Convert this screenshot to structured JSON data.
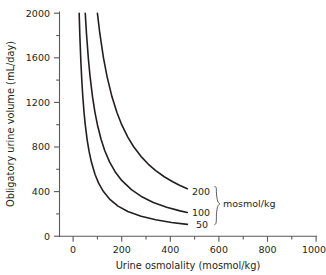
{
  "chart_data": {
    "type": "line",
    "title": "",
    "xlabel": "Urine osmolality (mosmol/kg)",
    "ylabel": "Obligatory urine volume (mL/day)",
    "xlim": [
      0,
      1000
    ],
    "ylim": [
      0,
      2000
    ],
    "xticks": [
      0,
      200,
      400,
      600,
      800,
      1000
    ],
    "xtick_labels": [
      "0",
      "200",
      "400",
      "600",
      "800",
      "1000"
    ],
    "xminor_step": 100,
    "yticks": [
      0,
      400,
      800,
      1200,
      1600,
      2000
    ],
    "ytick_labels": [
      "0",
      "400",
      "800",
      "1200",
      "1600",
      "2000"
    ],
    "yminor_step": 200,
    "grid": false,
    "legend_position": "inline-right",
    "legend_unit": "mosmol/kg",
    "series": [
      {
        "name": "200",
        "label": "200",
        "solute_load": 200,
        "x": [
          100,
          110,
          125,
          140,
          160,
          180,
          200,
          225,
          250,
          280,
          310,
          340,
          375,
          410,
          440,
          470
        ],
        "y": [
          2000,
          1818,
          1600,
          1429,
          1250,
          1111,
          1000,
          889,
          800,
          714,
          645,
          588,
          533,
          488,
          455,
          426
        ]
      },
      {
        "name": "100",
        "label": "100",
        "solute_load": 100,
        "x": [
          50,
          55,
          63,
          70,
          80,
          90,
          100,
          115,
          130,
          150,
          175,
          200,
          240,
          285,
          330,
          385,
          440,
          470
        ],
        "y": [
          2000,
          1818,
          1587,
          1429,
          1250,
          1111,
          1000,
          870,
          769,
          667,
          571,
          500,
          417,
          351,
          303,
          260,
          227,
          213
        ]
      },
      {
        "name": "50",
        "label": "50",
        "solute_load": 50,
        "x": [
          25,
          28,
          32,
          36,
          40,
          45,
          50,
          58,
          66,
          75,
          90,
          105,
          125,
          150,
          185,
          225,
          280,
          340,
          405,
          470
        ],
        "y": [
          2000,
          1786,
          1563,
          1389,
          1250,
          1111,
          1000,
          862,
          758,
          667,
          556,
          476,
          400,
          333,
          270,
          222,
          179,
          147,
          123,
          106
        ]
      }
    ]
  },
  "axes": {
    "y_title": "Obligatory urine volume (mL/day)",
    "x_title": "Urine osmolality (mosmol/kg)"
  },
  "annotations": {
    "unit": "mosmol/kg",
    "series_labels": [
      "200",
      "100",
      "50"
    ]
  }
}
